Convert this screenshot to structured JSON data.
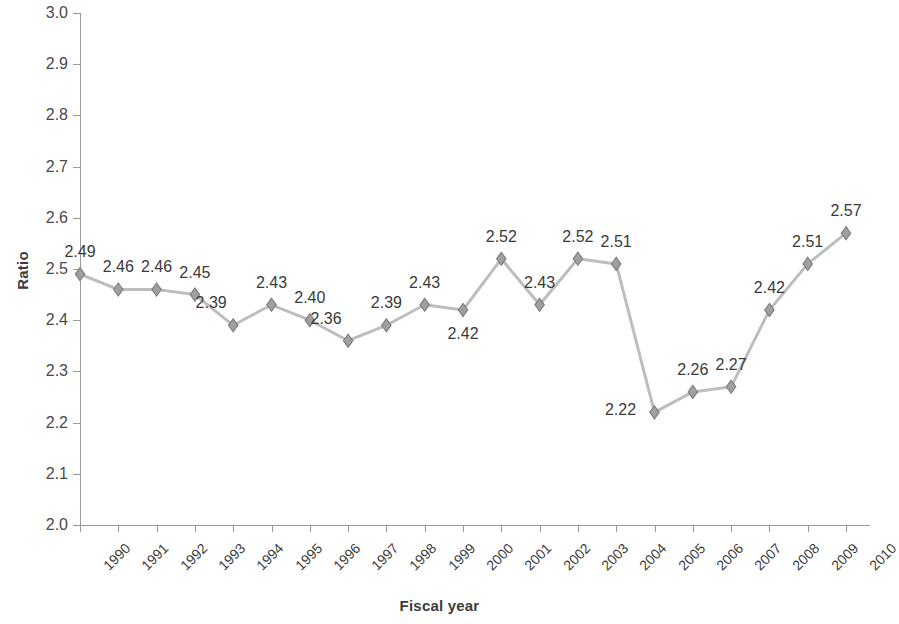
{
  "chart_data": {
    "type": "line",
    "title": "",
    "xlabel": "Fiscal year",
    "ylabel": "Ratio",
    "ylim": [
      2.0,
      3.0
    ],
    "ytick_labels": [
      "3.0",
      "2.9",
      "2.8",
      "2.7",
      "2.6",
      "2.5",
      "2.4",
      "2.3",
      "2.2",
      "2.1",
      "2.0"
    ],
    "ytick_values": [
      3.0,
      2.9,
      2.8,
      2.7,
      2.6,
      2.5,
      2.4,
      2.3,
      2.2,
      2.1,
      2.0
    ],
    "grid": false,
    "legend": null,
    "categories": [
      "1990",
      "1991",
      "1992",
      "1993",
      "1994",
      "1995",
      "1996",
      "1997",
      "1998",
      "1999",
      "2000",
      "2001",
      "2002",
      "2003",
      "2004",
      "2005",
      "2006",
      "2007",
      "2008",
      "2009",
      "2010"
    ],
    "values": [
      2.49,
      2.46,
      2.46,
      2.45,
      2.39,
      2.43,
      2.4,
      2.36,
      2.39,
      2.43,
      2.42,
      2.52,
      2.43,
      2.52,
      2.51,
      2.22,
      2.26,
      2.27,
      2.42,
      2.51,
      2.57
    ],
    "point_labels": [
      "2.49",
      "2.46",
      "2.46",
      "2.45",
      "2.39",
      "2.43",
      "2.40",
      "2.36",
      "2.39",
      "2.43",
      "2.42",
      "2.52",
      "2.43",
      "2.52",
      "2.51",
      "2.22",
      "2.26",
      "2.27",
      "2.42",
      "2.51",
      "2.57"
    ],
    "label_placement": [
      "above",
      "above",
      "above",
      "above",
      "above-left",
      "above",
      "above",
      "above-left",
      "above",
      "above",
      "below",
      "above",
      "above",
      "above",
      "above",
      "left",
      "above",
      "above",
      "above",
      "above",
      "above"
    ],
    "colors": {
      "line": "#bdbdbd",
      "marker_fill": "#a0a0a0",
      "marker_edge": "#808080",
      "axis": "#9a9a9a",
      "text": "#3a3a3a",
      "background": "#ffffff"
    },
    "marker": "diamond"
  }
}
